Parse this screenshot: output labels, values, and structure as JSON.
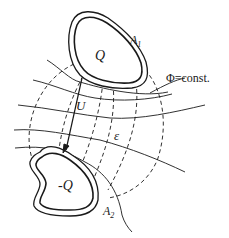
{
  "diagram": {
    "type": "capacitor-field-diagram",
    "colors": {
      "stroke": "#1a1a1a",
      "background": "#ffffff"
    },
    "conductors": [
      {
        "name": "A1",
        "label": "A",
        "subscript": "1",
        "charge": "Q"
      },
      {
        "name": "A2",
        "label": "A",
        "subscript": "2",
        "charge": "-Q"
      }
    ],
    "labels": {
      "potential": "Φ=const.",
      "voltage": "U",
      "permittivity": "ε"
    },
    "legend": {
      "solid_lines": "equipotential surfaces",
      "dashed_lines": "field lines"
    }
  }
}
